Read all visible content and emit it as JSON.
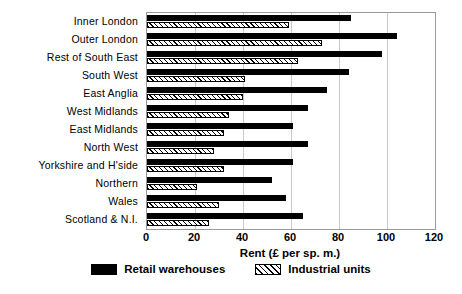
{
  "chart_data": {
    "type": "bar",
    "orientation": "horizontal",
    "title": "",
    "xlabel": "Rent (£ per sp. m.)",
    "ylabel": "",
    "xlim": [
      0,
      120
    ],
    "xticks": [
      0,
      20,
      40,
      60,
      80,
      100,
      120
    ],
    "grid": true,
    "legend_position": "bottom",
    "categories": [
      "Inner London",
      "Outer London",
      "Rest of South East",
      "South West",
      "East Anglia",
      "West Midlands",
      "East Midlands",
      "North West",
      "Yorkshire and H'side",
      "Northern",
      "Wales",
      "Scotland & N.I."
    ],
    "series": [
      {
        "name": "Retail warehouses",
        "color": "#000000",
        "values": [
          85,
          104,
          98,
          84,
          75,
          67,
          61,
          67,
          61,
          52,
          58,
          65
        ]
      },
      {
        "name": "Industrial units",
        "color": "#ffffff",
        "pattern": "diagonal-hatch",
        "values": [
          59,
          73,
          63,
          41,
          40,
          34,
          32,
          28,
          32,
          21,
          30,
          26
        ]
      }
    ]
  },
  "legend": {
    "items": [
      {
        "label": "Retail warehouses",
        "swatch": "solid-black-swatch"
      },
      {
        "label": "Industrial units",
        "swatch": "hatched-swatch"
      }
    ]
  }
}
